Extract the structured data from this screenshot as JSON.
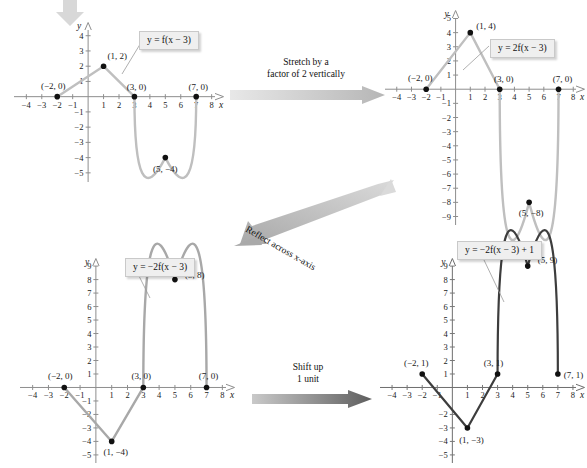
{
  "figure": {
    "colors": {
      "light_curve": "#bfbfbf",
      "mid_curve": "#a8a8a8",
      "dark_curve": "#3d3d3d",
      "axis": "#8e8e8e",
      "point": "#111111",
      "callout_fill": "#efefef",
      "arrow_light": "#d2d2d2",
      "arrow_dark": "#7a7a7a"
    }
  },
  "top_arrow": {
    "name": "down-arrow",
    "direction": "down"
  },
  "arrows": {
    "stretch": {
      "line1": "Stretch by a",
      "line2": "factor of 2 vertically",
      "direction": "right"
    },
    "reflect": {
      "text": "Reflect across x-axis",
      "direction": "down-left"
    },
    "shift": {
      "line1": "Shift up",
      "line2": "1 unit",
      "direction": "right"
    }
  },
  "panels": [
    {
      "id": "panel-1",
      "equation": "y = f(x − 3)",
      "equation_parts": {
        "lhs": "y",
        "eq": "=",
        "fn": "f",
        "arg": "(x − 3)"
      },
      "x_axis_label": "x",
      "y_axis_label": "y",
      "x_ticks": [
        -4,
        -3,
        -2,
        -1,
        1,
        2,
        3,
        4,
        5,
        6,
        7,
        8
      ],
      "x_tick_labels": [
        "−4",
        "−3",
        "−2",
        "−1",
        "1",
        "2",
        "3",
        "4",
        "5",
        "6",
        "7",
        "8"
      ],
      "y_ticks": [
        4,
        3,
        2,
        1,
        -1,
        -2,
        -3,
        -4,
        -5
      ],
      "y_tick_labels": [
        "4",
        "3",
        "2",
        "1",
        "−1",
        "−2",
        "−3",
        "−4",
        "−5"
      ],
      "xlim": [
        -4.8,
        8.8
      ],
      "ylim": [
        -5.6,
        4.9
      ],
      "points": [
        {
          "label": "(−2, 0)",
          "x": -2,
          "y": 0
        },
        {
          "label": "(1, 2)",
          "x": 1,
          "y": 2
        },
        {
          "label": "(3, 0)",
          "x": 3,
          "y": 0
        },
        {
          "label": "(5, −4)",
          "x": 5,
          "y": -4
        },
        {
          "label": "(7, 0)",
          "x": 7,
          "y": 0
        }
      ]
    },
    {
      "id": "panel-2",
      "equation": "y = 2f(x − 3)",
      "x_axis_label": "x",
      "y_axis_label": "y",
      "x_ticks": [
        -4,
        -3,
        -2,
        -1,
        1,
        2,
        3,
        4,
        5,
        6,
        7,
        8
      ],
      "x_tick_labels": [
        "−4",
        "−3",
        "−2",
        "−1",
        "1",
        "2",
        "3",
        "4",
        "5",
        "6",
        "7",
        "8"
      ],
      "y_ticks": [
        5,
        4,
        3,
        2,
        1,
        -1,
        -2,
        -3,
        -4,
        -5,
        -6,
        -7,
        -8,
        -9
      ],
      "y_tick_labels": [
        "5",
        "4",
        "3",
        "2",
        "1",
        "−1",
        "−2",
        "−3",
        "−4",
        "−5",
        "−6",
        "−7",
        "−8",
        "−9"
      ],
      "xlim": [
        -4.8,
        8.8
      ],
      "ylim": [
        -9.6,
        5.6
      ],
      "points": [
        {
          "label": "(−2, 0)",
          "x": -2,
          "y": 0
        },
        {
          "label": "(1, 4)",
          "x": 1,
          "y": 4
        },
        {
          "label": "(3, 0)",
          "x": 3,
          "y": 0
        },
        {
          "label": "(5, −8)",
          "x": 5,
          "y": -8
        },
        {
          "label": "(7, 0)",
          "x": 7,
          "y": 0
        }
      ]
    },
    {
      "id": "panel-3",
      "equation": "y = −2f(x − 3)",
      "x_axis_label": "x",
      "y_axis_label": "y",
      "x_ticks": [
        -4,
        -3,
        -2,
        -1,
        1,
        2,
        3,
        4,
        5,
        6,
        7,
        8
      ],
      "x_tick_labels": [
        "−4",
        "−3",
        "−2",
        "−1",
        "1",
        "2",
        "3",
        "4",
        "5",
        "6",
        "7",
        "8"
      ],
      "y_ticks": [
        9,
        8,
        7,
        6,
        5,
        4,
        3,
        2,
        1,
        -1,
        -2,
        -3,
        -4,
        -5
      ],
      "y_tick_labels": [
        "9",
        "8",
        "7",
        "6",
        "5",
        "4",
        "3",
        "2",
        "1",
        "−1",
        "−2",
        "−3",
        "−4",
        "−5"
      ],
      "xlim": [
        -4.8,
        8.8
      ],
      "ylim": [
        -5.6,
        9.6
      ],
      "points": [
        {
          "label": "(−2, 0)",
          "x": -2,
          "y": 0
        },
        {
          "label": "(1, −4)",
          "x": 1,
          "y": -4
        },
        {
          "label": "(3, 0)",
          "x": 3,
          "y": 0
        },
        {
          "label": "(5, 8)",
          "x": 5,
          "y": 8
        },
        {
          "label": "(7, 0)",
          "x": 7,
          "y": 0
        }
      ]
    },
    {
      "id": "panel-4",
      "equation": "y = −2f(x − 3) + 1",
      "x_axis_label": "x",
      "y_axis_label": "y",
      "x_ticks": [
        -4,
        -3,
        -2,
        -1,
        1,
        2,
        3,
        4,
        5,
        6,
        7,
        8
      ],
      "x_tick_labels": [
        "−4",
        "−3",
        "−2",
        "−1",
        "1",
        "2",
        "3",
        "4",
        "5",
        "6",
        "7",
        "8"
      ],
      "y_ticks": [
        9,
        8,
        7,
        6,
        5,
        4,
        3,
        2,
        1,
        -2,
        -3,
        -4,
        -5
      ],
      "y_tick_labels": [
        "9",
        "8",
        "7",
        "6",
        "5",
        "4",
        "3",
        "2",
        "1",
        "−2",
        "−3",
        "−4",
        "−5"
      ],
      "xlim": [
        -4.8,
        8.8
      ],
      "ylim": [
        -5.6,
        9.6
      ],
      "points": [
        {
          "label": "(−2, 1)",
          "x": -2,
          "y": 1
        },
        {
          "label": "(1, −3)",
          "x": 1,
          "y": -3
        },
        {
          "label": "(3, 1)",
          "x": 3,
          "y": 1
        },
        {
          "label": "(5, 9)",
          "x": 5,
          "y": 9
        },
        {
          "label": "(7, 1)",
          "x": 7,
          "y": 1
        }
      ]
    }
  ],
  "chart_data": {
    "type": "line",
    "series": [
      {
        "name": "y = f(x − 3)",
        "x": [
          -2,
          1,
          3,
          5,
          7
        ],
        "y": [
          0,
          2,
          0,
          -4,
          0
        ]
      },
      {
        "name": "y = 2f(x − 3)",
        "x": [
          -2,
          1,
          3,
          5,
          7
        ],
        "y": [
          0,
          4,
          0,
          -8,
          0
        ]
      },
      {
        "name": "y = −2f(x − 3)",
        "x": [
          -2,
          1,
          3,
          5,
          7
        ],
        "y": [
          0,
          -4,
          0,
          8,
          0
        ]
      },
      {
        "name": "y = −2f(x − 3) + 1",
        "x": [
          -2,
          1,
          3,
          5,
          7
        ],
        "y": [
          1,
          -3,
          1,
          9,
          1
        ]
      }
    ]
  }
}
